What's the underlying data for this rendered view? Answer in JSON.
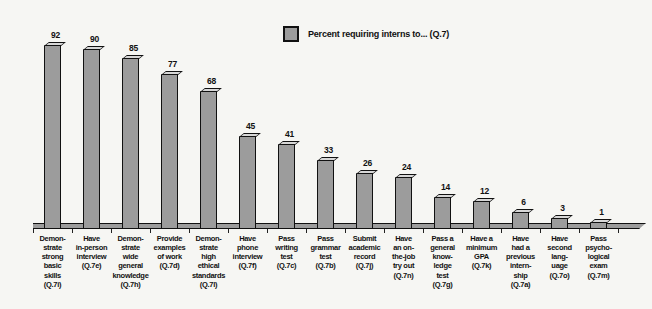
{
  "legend": {
    "label": "Percent requiring interns to... (Q.7)",
    "marker_color": "#9c9c9c"
  },
  "colors": {
    "bar_front": "#9c9c9c",
    "bar_top": "#d8d8d8",
    "outline": "#111111",
    "background": "#f6f6f3"
  },
  "chart_data": {
    "type": "bar",
    "title": "",
    "legend": [
      "Percent requiring interns to... (Q.7)"
    ],
    "legend_position": "top-center",
    "grid": false,
    "ylim": [
      0,
      100
    ],
    "xlabel": "",
    "ylabel": "",
    "categories": [
      "Demonstrate strong basic skills (Q.7i)",
      "Have in-person interview (Q.7e)",
      "Demonstrate wide general knowledge (Q.7h)",
      "Provide examples of work (Q.7d)",
      "Demonstrate high ethical standards (Q.7l)",
      "Have phone interview (Q.7f)",
      "Pass writing test (Q.7c)",
      "Pass grammar test (Q.7b)",
      "Submit academic record (Q.7j)",
      "Have an on-the-job try out (Q.7n)",
      "Pass a general knowledge test (Q.7g)",
      "Have a minimum GPA (Q.7k)",
      "Have had a previous internship (Q.7a)",
      "Have second language (Q.7o)",
      "Pass psychological exam (Q.7m)"
    ],
    "values": [
      92,
      90,
      85,
      77,
      68,
      45,
      41,
      33,
      26,
      24,
      14,
      12,
      6,
      3,
      1
    ],
    "label_lines": [
      [
        "Demon-",
        "strate",
        "strong",
        "basic",
        "skills",
        "(Q.7i)"
      ],
      [
        "Have",
        "in-person",
        "interview",
        "(Q.7e)"
      ],
      [
        "Demon-",
        "strate",
        "wide",
        "general",
        "knowledge",
        "(Q.7h)"
      ],
      [
        "Provide",
        "examples",
        "of work",
        "(Q.7d)"
      ],
      [
        "Demon-",
        "strate",
        "high",
        "ethical",
        "standards",
        "(Q.7l)"
      ],
      [
        "Have",
        "phone",
        "interview",
        "(Q.7f)"
      ],
      [
        "Pass",
        "writing",
        "test",
        "(Q.7c)"
      ],
      [
        "Pass",
        "grammar",
        "test",
        "(Q.7b)"
      ],
      [
        "Submit",
        "academic",
        "record",
        "(Q.7j)"
      ],
      [
        "Have",
        "an on-",
        "the-job",
        "try out",
        "(Q.7n)"
      ],
      [
        "Pass a",
        "general",
        "know-",
        "ledge",
        "test",
        "(Q.7g)"
      ],
      [
        "Have a",
        "minimum",
        "GPA",
        "(Q.7k)"
      ],
      [
        "Have",
        "had a",
        "previous",
        "intern-",
        "ship",
        "(Q.7a)"
      ],
      [
        "Have",
        "second",
        "lang-",
        "uage",
        "(Q.7o)"
      ],
      [
        "Pass",
        "psycho-",
        "logical",
        "exam",
        "(Q.7m)"
      ]
    ]
  }
}
